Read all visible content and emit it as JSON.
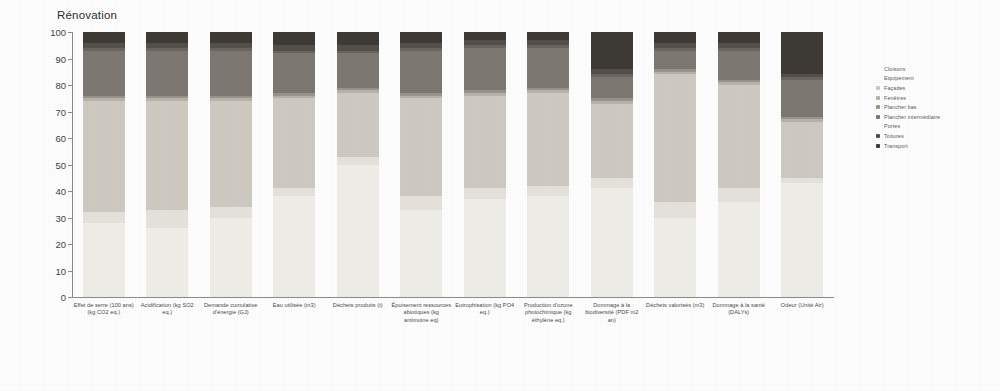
{
  "chart": {
    "title": "Rénovation",
    "yaxis": {
      "min": 0,
      "max": 100,
      "ticks": [
        "0",
        "10",
        "20",
        "30",
        "40",
        "50",
        "60",
        "70",
        "80",
        "90",
        "100"
      ]
    }
  },
  "legend": {
    "position": "right",
    "items": [
      {
        "label": "Cloisons",
        "color": "#f0eee9",
        "marker": "none"
      },
      {
        "label": "Equipement",
        "color": "#e6e3dc",
        "marker": "none"
      },
      {
        "label": "Façades",
        "color": "#cfcbc2",
        "marker": "square"
      },
      {
        "label": "Fenêtres",
        "color": "#b9b4aa",
        "marker": "square"
      },
      {
        "label": "Plancher bas",
        "color": "#9a958c",
        "marker": "square"
      },
      {
        "label": "Plancher intermédiaire",
        "color": "#7d7871",
        "marker": "square"
      },
      {
        "label": "Portes",
        "color": "#6a655f",
        "marker": "none"
      },
      {
        "label": "Toitures",
        "color": "#545049",
        "marker": "square"
      },
      {
        "label": "Transport",
        "color": "#3e3a35",
        "marker": "square"
      }
    ]
  },
  "chart_data": {
    "type": "bar",
    "stacked": true,
    "normalized_percent": true,
    "title": "Rénovation",
    "xlabel": "",
    "ylabel": "",
    "ylim": [
      0,
      100
    ],
    "grid": false,
    "legend_position": "right",
    "categories": [
      "Effet de serre (100 ans) (kg CO2 eq.)",
      "Acidification (kg SO2 eq.)",
      "Demande cumulative d'énergie (GJ)",
      "Eau utilisée (m3)",
      "Déchets produits (t)",
      "Épuisement ressources abiotiques (kg antimoine eq)",
      "Eutrophisation (kg PO4 eq.)",
      "Production d'ozone photochimique (kg éthylène eq.)",
      "Dommage à la biodiversité (PDF m2 an)",
      "Déchets valorisés (m3)",
      "Dommage à la santé (DALYs)",
      "Odeur (Unité Air)"
    ],
    "series": [
      {
        "name": "Cloisons",
        "color": "#f0eee9",
        "values": [
          28,
          26,
          30,
          38,
          50,
          33,
          37,
          38,
          41,
          30,
          36,
          43
        ]
      },
      {
        "name": "Equipement",
        "color": "#e6e3dc",
        "values": [
          4,
          7,
          4,
          3,
          3,
          5,
          4,
          4,
          4,
          6,
          5,
          2
        ]
      },
      {
        "name": "Façades",
        "color": "#cfcbc2",
        "values": [
          42,
          41,
          40,
          34,
          24,
          37,
          35,
          35,
          28,
          48,
          39,
          21
        ]
      },
      {
        "name": "Fenêtres",
        "color": "#b9b4aa",
        "values": [
          1,
          1,
          1,
          1,
          1,
          1,
          1,
          1,
          1,
          1,
          1,
          1
        ]
      },
      {
        "name": "Plancher bas",
        "color": "#9a958c",
        "values": [
          1,
          1,
          1,
          1,
          1,
          1,
          1,
          1,
          1,
          1,
          1,
          1
        ]
      },
      {
        "name": "Plancher intermédiaire",
        "color": "#7d7871",
        "values": [
          17,
          17,
          17,
          15,
          13,
          16,
          16,
          15,
          8,
          7,
          11,
          14
        ]
      },
      {
        "name": "Portes",
        "color": "#6a655f",
        "values": [
          1,
          1,
          1,
          1,
          1,
          1,
          1,
          1,
          1,
          1,
          1,
          1
        ]
      },
      {
        "name": "Toitures",
        "color": "#545049",
        "values": [
          2,
          2,
          2,
          2,
          2,
          2,
          2,
          2,
          2,
          2,
          2,
          1
        ]
      },
      {
        "name": "Transport",
        "color": "#3e3a35",
        "values": [
          4,
          4,
          4,
          5,
          5,
          4,
          3,
          3,
          14,
          4,
          4,
          16
        ]
      }
    ]
  }
}
